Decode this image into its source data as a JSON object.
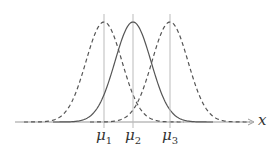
{
  "diagram": {
    "axis_label": "x",
    "means": [
      {
        "label_main": "μ",
        "label_sub": "1",
        "x": 104,
        "style": "dashed"
      },
      {
        "label_main": "μ",
        "label_sub": "2",
        "x": 133,
        "style": "solid"
      },
      {
        "label_main": "μ",
        "label_sub": "3",
        "x": 170,
        "style": "dashed"
      }
    ],
    "colors": {
      "curve": "#555555",
      "guide": "#bbbbbb",
      "axis": "#999999"
    }
  }
}
